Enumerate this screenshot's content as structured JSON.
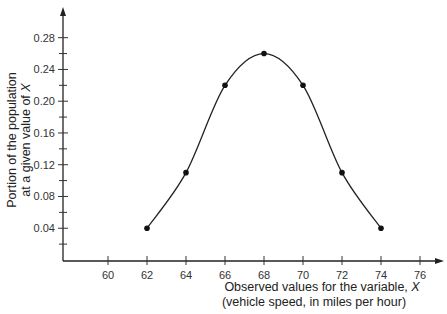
{
  "chart_data": {
    "type": "line",
    "title": "",
    "xlabel_line1": "Observed values for the variable, ",
    "xlabel_var": "X",
    "xlabel_line2": "(vehicle speed, in miles per hour)",
    "ylabel_line1": "Portion of the population",
    "ylabel_line2": "at a given value of ",
    "ylabel_var": "X",
    "x": [
      62,
      64,
      66,
      68,
      70,
      72,
      74
    ],
    "values": [
      0.04,
      0.11,
      0.22,
      0.26,
      0.22,
      0.11,
      0.04
    ],
    "x_ticks": [
      "60",
      "62",
      "64",
      "66",
      "68",
      "70",
      "72",
      "74",
      "76"
    ],
    "y_ticks": [
      "0.04",
      "0.08",
      "0.12",
      "0.16",
      "0.20",
      "0.24",
      "0.28"
    ],
    "xlim": [
      58,
      77
    ],
    "ylim": [
      0,
      0.31
    ],
    "grid": false,
    "markers": true,
    "smooth_curve": true
  }
}
